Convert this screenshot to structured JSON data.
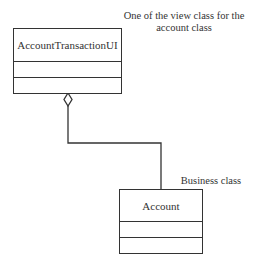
{
  "diagram": {
    "type": "UML class diagram",
    "classes": [
      {
        "name": "AccountTransactionUI",
        "attributes": [],
        "operations": []
      },
      {
        "name": "Account",
        "attributes": [],
        "operations": []
      }
    ],
    "relationship": {
      "type": "aggregation",
      "whole": "AccountTransactionUI",
      "part": "Account"
    },
    "notes": {
      "view_class": "One of the view class for the account class",
      "business_class": "Business class"
    }
  },
  "colors": {
    "line": "#333333",
    "background": "#ffffff"
  }
}
